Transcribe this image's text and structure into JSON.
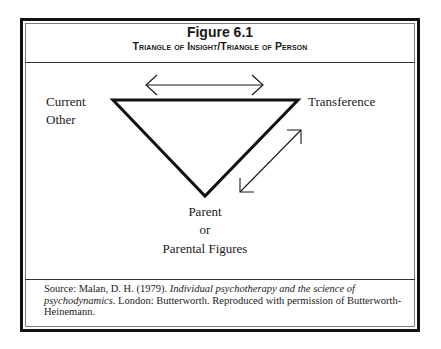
{
  "figure": {
    "title": "Figure 6.1",
    "subtitle": "Triangle of Insight/Triangle of Person"
  },
  "diagram": {
    "type": "inverted-triangle",
    "vertices": {
      "top_left": "Current Other",
      "top_right": "Transference",
      "bottom": "Parent or Parental Figures"
    },
    "labels": {
      "current": "Current",
      "other": "Other",
      "transference": "Transference",
      "parent": "Parent",
      "or": "or",
      "parental_figures": "Parental Figures"
    },
    "arrows": [
      {
        "between": [
          "Current Other",
          "Transference"
        ],
        "type": "double-headed",
        "position": "above top edge"
      },
      {
        "between": [
          "Transference",
          "Parent or Parental Figures"
        ],
        "type": "double-headed",
        "position": "beside right edge"
      }
    ],
    "colors": {
      "stroke": "#111111",
      "frame": "#111111",
      "inner_frame": "#7a7a7a"
    }
  },
  "source": {
    "prefix": "Source: Malan, D. H. (1979). ",
    "title_italic": "Individual psychotherapy and the science of psychodynamics",
    "suffix": ". London: Butterworth. Reproduced with permission of Butterworth-Heinemann."
  }
}
